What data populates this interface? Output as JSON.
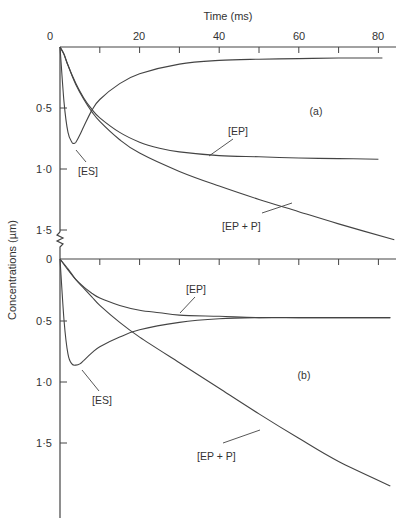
{
  "title": "Time (ms)",
  "ylabel": "Concentrations (µm)",
  "x_ticks": [
    0,
    20,
    40,
    60,
    80
  ],
  "chart_data": [
    {
      "type": "line",
      "panel": "(a)",
      "xlabel": "Time (ms)",
      "ylabel": "Concentrations (µm)",
      "xlim": [
        0,
        85
      ],
      "ylim": [
        0,
        1.6
      ],
      "y_inverted": true,
      "x_ticks": [
        0,
        20,
        40,
        60,
        80
      ],
      "y_ticks": [
        "0",
        "0·5",
        "1·0",
        "1·5"
      ],
      "series": [
        {
          "name": "[ES]",
          "x": [
            0,
            1,
            2,
            3,
            3.5,
            4,
            5,
            6,
            8,
            10,
            15,
            20,
            30,
            40,
            50,
            60,
            70,
            81
          ],
          "y": [
            0,
            0.45,
            0.7,
            0.78,
            0.79,
            0.78,
            0.72,
            0.65,
            0.52,
            0.43,
            0.3,
            0.22,
            0.14,
            0.11,
            0.1,
            0.095,
            0.09,
            0.09
          ]
        },
        {
          "name": "[EP]",
          "x": [
            0,
            1,
            2,
            4,
            6,
            8,
            10,
            15,
            20,
            25,
            30,
            40,
            50,
            60,
            70,
            80
          ],
          "y": [
            0,
            0.06,
            0.15,
            0.3,
            0.42,
            0.51,
            0.58,
            0.7,
            0.78,
            0.83,
            0.86,
            0.89,
            0.9,
            0.91,
            0.915,
            0.92
          ]
        },
        {
          "name": "[EP + P]",
          "x": [
            0,
            1,
            2,
            4,
            6,
            8,
            10,
            15,
            20,
            30,
            40,
            50,
            60,
            70,
            84
          ],
          "y": [
            0,
            0.06,
            0.15,
            0.31,
            0.43,
            0.53,
            0.61,
            0.76,
            0.87,
            1.02,
            1.14,
            1.25,
            1.35,
            1.45,
            1.58
          ]
        }
      ]
    },
    {
      "type": "line",
      "panel": "(b)",
      "xlabel": "Time (ms)",
      "ylabel": "Concentrations (µm)",
      "xlim": [
        0,
        85
      ],
      "ylim": [
        0,
        2.1
      ],
      "y_inverted": true,
      "x_ticks": [
        0,
        20,
        40,
        60,
        80
      ],
      "y_ticks": [
        "0",
        "0·5",
        "1·0",
        "1·5"
      ],
      "series": [
        {
          "name": "[ES]",
          "x": [
            0,
            1,
            2,
            3,
            4,
            5,
            6,
            8,
            10,
            15,
            20,
            30,
            40,
            50,
            60,
            70,
            83
          ],
          "y": [
            0,
            0.5,
            0.78,
            0.86,
            0.87,
            0.86,
            0.83,
            0.77,
            0.72,
            0.64,
            0.58,
            0.52,
            0.49,
            0.48,
            0.48,
            0.48,
            0.48
          ]
        },
        {
          "name": "[EP]",
          "x": [
            0,
            2,
            4,
            6,
            8,
            10,
            15,
            20,
            25,
            30,
            40,
            50,
            60,
            70,
            83
          ],
          "y": [
            0,
            0.09,
            0.17,
            0.23,
            0.28,
            0.32,
            0.38,
            0.42,
            0.44,
            0.46,
            0.47,
            0.48,
            0.48,
            0.48,
            0.48
          ]
        },
        {
          "name": "[EP + P]",
          "x": [
            0,
            2,
            4,
            6,
            8,
            10,
            15,
            20,
            30,
            40,
            50,
            60,
            70,
            83
          ],
          "y": [
            0,
            0.08,
            0.17,
            0.24,
            0.31,
            0.38,
            0.52,
            0.64,
            0.85,
            1.06,
            1.27,
            1.47,
            1.66,
            1.86
          ]
        }
      ]
    }
  ],
  "labels": {
    "a": {
      "panel": "(a)",
      "es": "[ES]",
      "ep": "[EP]",
      "epp": "[EP + P]"
    },
    "b": {
      "panel": "(b)",
      "es": "[ES]",
      "ep": "[EP]",
      "epp": "[EP + P]"
    }
  },
  "ytick_labels": {
    "zero": "0",
    "half": "0·5",
    "one": "1·0",
    "onehalf": "1·5"
  },
  "xtick_labels": {
    "t0": "0",
    "t20": "20",
    "t40": "40",
    "t60": "60",
    "t80": "80"
  }
}
